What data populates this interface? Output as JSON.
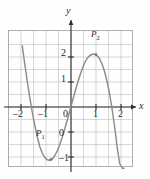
{
  "figure": {
    "kind": "cartesian-graph",
    "background_color": "#fefefe",
    "grid_color": "#b9b9b9",
    "axis_color": "#2b2b2b",
    "curve_color": "#8a8a8a"
  },
  "axes": {
    "x_axis_label": "x",
    "y_axis_label": "y",
    "x_ticks": [
      "2",
      "1",
      "0",
      "1",
      "2"
    ],
    "x_tick_display": [
      "–2",
      "–1",
      "0",
      "1",
      "2"
    ],
    "y_tick_display": [
      "2",
      "1",
      "0",
      "–1",
      "–2"
    ]
  },
  "points": [
    {
      "id": "P1",
      "label_main": "P",
      "label_sub": "1",
      "x": -0.8,
      "y": -2.1
    },
    {
      "id": "P2",
      "label_main": "P",
      "label_sub": "2",
      "x": 1.0,
      "y": 2.1
    }
  ],
  "chart_data": {
    "type": "line",
    "title": "",
    "xlabel": "x",
    "ylabel": "y",
    "xlim": [
      -2.25,
      2.25
    ],
    "ylim": [
      -2.4,
      2.4
    ],
    "xticks": [
      -2,
      -1,
      0,
      1,
      2
    ],
    "yticks": [
      -2,
      -1,
      0,
      1,
      2
    ],
    "grid": true,
    "grid_step": 0.5,
    "legend": "none",
    "series": [
      {
        "name": "curve",
        "description": "cubic-like curve: falls steeply from upper left, local minimum P1 near (-0.8,-2.1), rises through origin, local maximum P2 near (1.0,2.1), then falls steeply through x=1.8 and exits bottom near x=2.1",
        "x": [
          -1.95,
          -1.85,
          -1.75,
          -1.65,
          -1.55,
          -1.45,
          -1.35,
          -1.25,
          -1.15,
          -1.05,
          -0.95,
          -0.85,
          -0.75,
          -0.65,
          -0.55,
          -0.45,
          -0.35,
          -0.25,
          -0.15,
          -0.05,
          0.05,
          0.15,
          0.25,
          0.35,
          0.45,
          0.55,
          0.65,
          0.75,
          0.85,
          0.95,
          1.05,
          1.15,
          1.25,
          1.35,
          1.45,
          1.55,
          1.65,
          1.75,
          1.85,
          1.95,
          2.05,
          2.12
        ],
        "y": [
          2.45,
          1.72,
          1.03,
          0.39,
          -0.2,
          -0.73,
          -1.19,
          -1.58,
          -1.85,
          -2.02,
          -2.11,
          -2.13,
          -2.08,
          -1.95,
          -1.76,
          -1.51,
          -1.21,
          -0.88,
          -0.52,
          -0.16,
          0.21,
          0.57,
          0.92,
          1.24,
          1.53,
          1.77,
          1.95,
          2.06,
          2.11,
          2.11,
          2.05,
          1.92,
          1.7,
          1.39,
          0.99,
          0.49,
          -0.12,
          -0.83,
          -1.64,
          -2.27,
          -2.45,
          -2.45
        ]
      }
    ],
    "annotations": [
      {
        "text": "P₁",
        "x": -0.8,
        "y": -2.1,
        "position": "above-left"
      },
      {
        "text": "P₂",
        "x": 1.0,
        "y": 2.1,
        "position": "above"
      }
    ]
  }
}
